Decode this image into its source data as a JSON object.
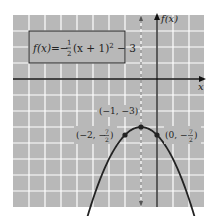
{
  "chart_data": {
    "type": "line",
    "title": "",
    "equation": {
      "lhs": "f(x)",
      "eq": "=",
      "sign": "−",
      "frac_num": "1",
      "frac_den": "2",
      "body": "(x + 1)",
      "exp": "2",
      "tail": " − 3"
    },
    "xlabel": "x",
    "ylabel": "f(x)",
    "xlim": [
      -9,
      3
    ],
    "ylim": [
      -8,
      4
    ],
    "grid": true,
    "axis_of_symmetry": {
      "x": -1,
      "style": "dashed"
    },
    "function": "f(x) = -1/2 (x+1)^2 - 3",
    "series": [
      {
        "name": "f(x)",
        "x": [
          -5,
          -4,
          -3,
          -2,
          -1,
          0,
          1,
          2,
          3
        ],
        "values": [
          -11,
          -7.5,
          -5,
          -3.5,
          -3,
          -3.5,
          -5,
          -7.5,
          -11
        ]
      }
    ],
    "points": [
      {
        "x": -1,
        "y": -3,
        "label": "(−1, −3)"
      },
      {
        "x": -2,
        "y": -3.5,
        "label_pre": "(−2, −",
        "num": "7",
        "den": "2",
        "label_post": ")"
      },
      {
        "x": 0,
        "y": -3.5,
        "label_pre": "(0, −",
        "num": "7",
        "den": "2",
        "label_post": ")"
      }
    ],
    "colors": {
      "background": "#b8b8b8",
      "grid": "#ffffff",
      "axis": "#111111",
      "curve": "#222222"
    }
  }
}
